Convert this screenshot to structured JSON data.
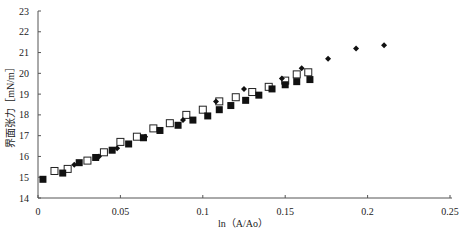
{
  "chart_data": {
    "type": "scatter",
    "title": "",
    "xlabel": "ln（A/Ao）",
    "ylabel": "界面张力［mN/m］",
    "xlim": [
      0,
      0.25
    ],
    "ylim": [
      14,
      23
    ],
    "x_ticks": [
      "0",
      "0.05",
      "0.1",
      "0.15",
      "0.2",
      "0.25"
    ],
    "y_ticks": [
      "14",
      "15",
      "16",
      "17",
      "18",
      "19",
      "20",
      "21",
      "22",
      "23"
    ],
    "grid": false,
    "legend": "none",
    "series": [
      {
        "name": "open-square",
        "marker": "square-open",
        "x": [
          0.01,
          0.018,
          0.03,
          0.04,
          0.05,
          0.06,
          0.07,
          0.08,
          0.09,
          0.1,
          0.11,
          0.12,
          0.13,
          0.14,
          0.15,
          0.157,
          0.164
        ],
        "y": [
          15.3,
          15.4,
          15.8,
          16.2,
          16.7,
          16.95,
          17.35,
          17.6,
          18.0,
          18.25,
          18.65,
          18.85,
          19.1,
          19.35,
          19.65,
          19.95,
          20.05
        ]
      },
      {
        "name": "filled-square",
        "marker": "square-filled",
        "x": [
          0.003,
          0.015,
          0.025,
          0.035,
          0.045,
          0.055,
          0.064,
          0.074,
          0.085,
          0.094,
          0.103,
          0.11,
          0.117,
          0.126,
          0.134,
          0.142,
          0.15,
          0.157,
          0.165
        ],
        "y": [
          14.9,
          15.2,
          15.7,
          15.95,
          16.3,
          16.6,
          16.9,
          17.25,
          17.5,
          17.75,
          17.95,
          18.25,
          18.45,
          18.7,
          18.95,
          19.25,
          19.45,
          19.6,
          19.7
        ]
      },
      {
        "name": "diamond",
        "marker": "diamond-filled",
        "x": [
          0.022,
          0.037,
          0.048,
          0.065,
          0.088,
          0.108,
          0.125,
          0.148,
          0.16,
          0.176,
          0.193,
          0.21
        ],
        "y": [
          15.6,
          16.0,
          16.4,
          16.95,
          17.75,
          18.65,
          19.25,
          19.75,
          20.25,
          20.7,
          21.2,
          21.35
        ]
      }
    ]
  }
}
